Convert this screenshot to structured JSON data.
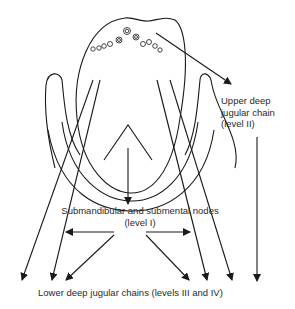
{
  "figure": {
    "labels": {
      "upper": [
        "Upper deep",
        "jugular chain",
        "(level II)"
      ],
      "submandibular_line1": "Submandibular and submental nodes",
      "submandibular_line2": "(level  I)",
      "lower": "Lower deep jugular chains  (levels III and IV)"
    },
    "colors": {
      "line": "#1a1a1a",
      "text": "#2a2a2a",
      "background": "#ffffff"
    }
  }
}
